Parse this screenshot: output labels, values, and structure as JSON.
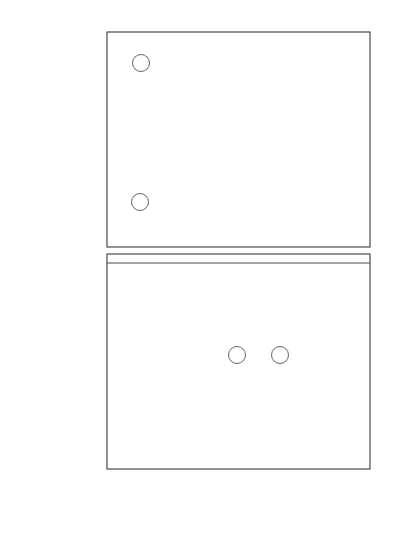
{
  "chart_data": [
    {
      "panel": "top",
      "type": "line",
      "title": "",
      "xlabel": "E_D (V vs. RHE)",
      "ylabel": "I_R (μA)",
      "ylabel_main": "I",
      "ylabel_sub": "R",
      "ylabel_unit": "(μA)",
      "xlim": [
        0,
        1.0
      ],
      "ylim": [
        -3,
        65
      ],
      "yticks": [
        0,
        20,
        40,
        60
      ],
      "ytick_labels": [
        "0",
        "20",
        "40",
        "60"
      ],
      "grid": false,
      "legend_position": "inline circled labels",
      "series": [
        {
          "name": "a",
          "x": [
            0.05,
            0.1,
            0.2,
            0.3,
            0.4,
            0.45,
            0.5,
            0.55,
            0.6,
            0.65,
            0.7,
            0.75,
            0.8,
            0.85,
            0.9,
            1.0
          ],
          "values": [
            50.5,
            50.8,
            51.2,
            51.5,
            51.3,
            50.8,
            49.5,
            45.5,
            36.0,
            24.0,
            12.0,
            4.0,
            0.8,
            0.3,
            0.2,
            0.1
          ]
        },
        {
          "name": "b",
          "x": [
            0.05,
            0.1,
            0.2,
            0.3,
            0.4,
            0.5,
            0.55,
            0.6,
            0.65,
            0.7,
            0.75,
            0.8,
            0.9,
            1.0
          ],
          "values": [
            6.0,
            6.1,
            6.3,
            6.5,
            6.6,
            6.5,
            5.5,
            4.0,
            2.5,
            1.2,
            0.4,
            0.2,
            0.1,
            0.1
          ]
        }
      ]
    },
    {
      "panel": "bottom",
      "type": "line",
      "title": "",
      "xlabel": "E_D (V vs. RHE)",
      "ylabel": "I_D (mA)",
      "ylabel_main": "I",
      "ylabel_sub": "D",
      "ylabel_unit": "(mA)",
      "xlim": [
        0,
        1.0
      ],
      "ylim": [
        -1.55,
        0.07
      ],
      "xticks": [
        0,
        0.2,
        0.4,
        0.6,
        0.8,
        1.0
      ],
      "xtick_labels": [
        "0",
        "0.2",
        "0.4",
        "0.6",
        "0.8",
        "1.0"
      ],
      "yticks": [
        0,
        -0.5,
        -1.0,
        -1.5
      ],
      "ytick_labels": [
        "0",
        "−0.5",
        "−1.0",
        "−1.5"
      ],
      "grid": false,
      "legend_position": "inline circled labels",
      "series": [
        {
          "name": "a",
          "x": [
            0.05,
            0.1,
            0.2,
            0.3,
            0.4,
            0.45,
            0.5,
            0.55,
            0.6,
            0.65,
            0.7,
            0.75,
            0.8,
            0.85,
            0.9,
            1.0
          ],
          "values": [
            -1.4,
            -1.38,
            -1.32,
            -1.25,
            -1.17,
            -1.11,
            -1.03,
            -0.92,
            -0.78,
            -0.58,
            -0.35,
            -0.14,
            -0.03,
            -0.01,
            0.0,
            0.0
          ]
        },
        {
          "name": "b",
          "x": [
            0.05,
            0.1,
            0.2,
            0.3,
            0.4,
            0.45,
            0.5,
            0.55,
            0.6,
            0.65,
            0.7,
            0.75,
            0.8,
            0.85,
            0.9,
            1.0
          ],
          "values": [
            -1.27,
            -1.25,
            -1.2,
            -1.13,
            -1.05,
            -0.98,
            -0.88,
            -0.78,
            -0.64,
            -0.46,
            -0.26,
            -0.1,
            -0.02,
            -0.01,
            0.0,
            0.0
          ]
        }
      ]
    }
  ],
  "labels": {
    "top_a": "a",
    "top_b": "b",
    "bottom_a": "a",
    "bottom_b": "b",
    "x_axis_main": "E",
    "x_axis_sub": "D",
    "x_axis_unit": "(V vs. RHE)",
    "top_y_main": "I",
    "top_y_sub": "R",
    "top_y_unit": "(μA)",
    "bottom_y_main": "I",
    "bottom_y_sub": "D",
    "bottom_y_unit": "(mA)"
  },
  "colors": {
    "axis": "#4a4a4a",
    "curve_top": "#555555",
    "curve_bottom": "#222222",
    "text": "#3a3a3a"
  }
}
